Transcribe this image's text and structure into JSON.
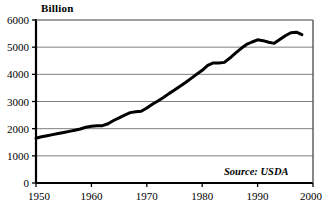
{
  "chart_data": {
    "type": "line",
    "title": "",
    "subtitle": "",
    "unit_label": "Billion",
    "source_note": "Source: USDA",
    "xlabel": "",
    "ylabel": "",
    "xlim": [
      1950,
      2000
    ],
    "ylim": [
      0,
      6000
    ],
    "grid": true,
    "legend": null,
    "x_ticks": [
      1950,
      1960,
      1970,
      1980,
      1990,
      2000
    ],
    "y_ticks": [
      0,
      1000,
      2000,
      3000,
      4000,
      5000,
      6000
    ],
    "x_tick_labels": [
      "1950",
      "1960",
      "1970",
      "1980",
      "1990",
      "2000"
    ],
    "y_tick_labels": [
      "0",
      "1000",
      "2000",
      "3000",
      "4000",
      "5000",
      "6000"
    ],
    "line_color": "#000000",
    "line_width": 3,
    "grid_color": "#808080",
    "axis_color": "#000000",
    "background_color": "#ffffff",
    "x": [
      1950,
      1951,
      1952,
      1953,
      1954,
      1955,
      1956,
      1957,
      1958,
      1959,
      1960,
      1961,
      1962,
      1963,
      1964,
      1965,
      1966,
      1967,
      1968,
      1969,
      1970,
      1971,
      1972,
      1973,
      1974,
      1975,
      1976,
      1977,
      1978,
      1979,
      1980,
      1981,
      1982,
      1983,
      1984,
      1985,
      1986,
      1987,
      1988,
      1989,
      1990,
      1991,
      1992,
      1993,
      1994,
      1995,
      1996,
      1997,
      1998
    ],
    "values": [
      1650,
      1700,
      1740,
      1780,
      1820,
      1860,
      1900,
      1940,
      1990,
      2050,
      2090,
      2110,
      2110,
      2180,
      2300,
      2400,
      2500,
      2590,
      2620,
      2640,
      2760,
      2900,
      3020,
      3150,
      3290,
      3420,
      3560,
      3700,
      3850,
      4000,
      4150,
      4330,
      4420,
      4420,
      4440,
      4600,
      4780,
      4950,
      5100,
      5190,
      5270,
      5240,
      5180,
      5140,
      5280,
      5420,
      5530,
      5550,
      5460
    ],
    "series": [
      {
        "name": "Billion",
        "values": [
          1650,
          1700,
          1740,
          1780,
          1820,
          1860,
          1900,
          1940,
          1990,
          2050,
          2090,
          2110,
          2110,
          2180,
          2300,
          2400,
          2500,
          2590,
          2620,
          2640,
          2760,
          2900,
          3020,
          3150,
          3290,
          3420,
          3560,
          3700,
          3850,
          4000,
          4150,
          4330,
          4420,
          4420,
          4440,
          4600,
          4780,
          4950,
          5100,
          5190,
          5270,
          5240,
          5180,
          5140,
          5280,
          5420,
          5530,
          5550,
          5460
        ]
      }
    ]
  },
  "plot_geometry": {
    "left": 36,
    "right": 313,
    "top": 20,
    "bottom": 183
  }
}
